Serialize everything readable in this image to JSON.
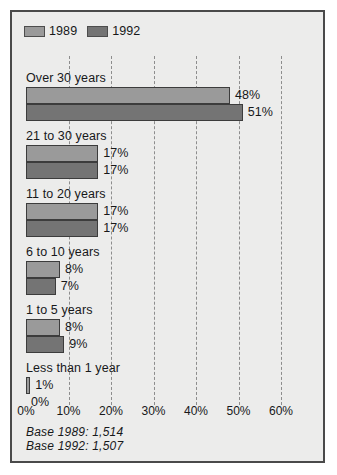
{
  "chart_data": {
    "type": "bar",
    "orientation": "horizontal",
    "title": "",
    "subtitle": "",
    "xlabel": "",
    "ylabel": "",
    "xlim": [
      0,
      60
    ],
    "xticks": [
      "0%",
      "10%",
      "20%",
      "30%",
      "40%",
      "50%",
      "60%"
    ],
    "xtick_values": [
      0,
      10,
      20,
      30,
      40,
      50,
      60
    ],
    "grid": true,
    "grid_axis": "x",
    "grid_style": "dashed",
    "legend_position": "top-left",
    "categories": [
      "Over 30 years",
      "21 to 30 years",
      "11 to 20 years",
      "6 to 10 years",
      "1 to 5 years",
      "Less than 1 year"
    ],
    "series": [
      {
        "name": "1989",
        "color": "#9a9a9a",
        "values": [
          48,
          17,
          17,
          8,
          8,
          1
        ],
        "labels": [
          "48%",
          "17%",
          "17%",
          "8%",
          "8%",
          "1%"
        ]
      },
      {
        "name": "1992",
        "color": "#747474",
        "values": [
          51,
          17,
          17,
          7,
          9,
          0
        ],
        "labels": [
          "51%",
          "17%",
          "17%",
          "7%",
          "9%",
          "0%"
        ]
      }
    ],
    "annotations": [
      "Base 1989: 1,514",
      "Base 1992: 1,507"
    ]
  },
  "legend": {
    "items": [
      {
        "label": "1989",
        "color": "#9a9a9a"
      },
      {
        "label": "1992",
        "color": "#747474"
      }
    ]
  },
  "footnote": {
    "lines": [
      "Base 1989: 1,514",
      "Base 1992: 1,507"
    ]
  },
  "colors": {
    "series_1989": "#9a9a9a",
    "series_1992": "#747474",
    "background": "#ececeb",
    "frame": "#4a4a4a",
    "text": "#17181a",
    "gridline": "#8d8d8d"
  }
}
